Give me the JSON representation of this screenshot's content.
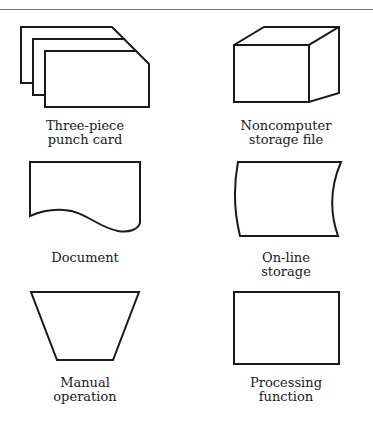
{
  "page": {
    "background": "#fefefe",
    "ink": "#1a1a1a",
    "rule_color": "#6e6e6e"
  },
  "symbols": [
    {
      "name": "three-piece-punch-card",
      "shape": "stack of three cards with cut top-right corners",
      "label_line1": "Three-piece",
      "label_line2": "punch card"
    },
    {
      "name": "noncomputer-storage-file",
      "shape": "3d box / cube",
      "label_line1": "Noncomputer",
      "label_line2": "storage file"
    },
    {
      "name": "document",
      "shape": "rectangle with wavy bottom edge",
      "label_line1": "Document",
      "label_line2": ""
    },
    {
      "name": "online-storage",
      "shape": "rectangle with left-bowed curved sides",
      "label_line1": "On-line",
      "label_line2": "storage"
    },
    {
      "name": "manual-operation",
      "shape": "inverted trapezoid",
      "label_line1": "Manual",
      "label_line2": "operation"
    },
    {
      "name": "processing-function",
      "shape": "rectangle",
      "label_line1": "Processing",
      "label_line2": "function"
    }
  ]
}
